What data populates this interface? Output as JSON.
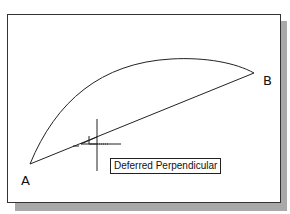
{
  "drawing": {
    "points": [
      {
        "label": "A",
        "x": 29,
        "y": 163
      },
      {
        "label": "B",
        "x": 253,
        "y": 72
      }
    ],
    "arc": {
      "from": "A",
      "to": "B",
      "peak": {
        "x": 180,
        "y": 57
      }
    },
    "line": {
      "from": "A",
      "to": "B"
    },
    "cursor": {
      "type": "crosshair",
      "x": 96,
      "y": 142
    },
    "snap_marker": "perpendicular-icon"
  },
  "labels": {
    "point_a": "A",
    "point_b": "B"
  },
  "tooltip": {
    "text": "Deferred Perpendicular"
  },
  "colors": {
    "line": "#222222",
    "frame": "#333333",
    "shadow": "#a9a9a9",
    "background": "#ffffff"
  }
}
